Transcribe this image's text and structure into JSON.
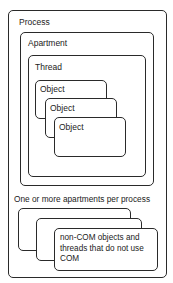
{
  "diagram": {
    "process": {
      "label": "Process"
    },
    "apartment": {
      "label": "Apartment"
    },
    "thread": {
      "label": "Thread"
    },
    "objects": [
      {
        "label": "Object"
      },
      {
        "label": "Object"
      },
      {
        "label": "Object"
      }
    ],
    "caption": "One or more apartments per process",
    "non_com": {
      "label": "non-COM objects and threads that do not use COM"
    }
  }
}
